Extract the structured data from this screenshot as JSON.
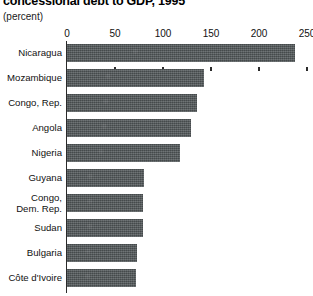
{
  "chart_data": {
    "type": "bar",
    "orientation": "horizontal",
    "title": "concessional debt to GDP, 1995",
    "subtitle": "(percent)",
    "xlabel": "",
    "ylabel": "",
    "xlim": [
      0,
      250
    ],
    "xticks": [
      0,
      50,
      100,
      150,
      200,
      250
    ],
    "xtick_labels": [
      "0",
      "50",
      "100",
      "150",
      "200",
      "250"
    ],
    "grid": false,
    "legend": null,
    "bar_color": "#53585a",
    "axis_color": "#2b2b2b",
    "categories": [
      "Nicaragua",
      "Mozambique",
      "Congo, Rep.",
      "Angola",
      "Nigeria",
      "Guyana",
      "Congo,\nDem. Rep.",
      "Sudan",
      "Bulgaria",
      "Côte d'Ivoire"
    ],
    "values": [
      238,
      143,
      135,
      129,
      118,
      80,
      79,
      79,
      73,
      72
    ]
  }
}
